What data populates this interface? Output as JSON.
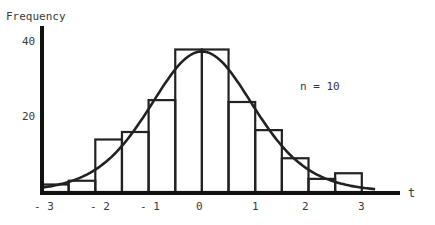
{
  "chart_data": {
    "type": "bar",
    "title": "",
    "ylabel": "Frequency",
    "xlabel": "t",
    "annotation": "n = 10",
    "xlim": [
      -3,
      3.3
    ],
    "ylim": [
      0,
      42
    ],
    "grid": false,
    "legend": null,
    "xticks": [
      "-3",
      "-2",
      "-1",
      "0",
      "1",
      "2",
      "3"
    ],
    "yticks": [
      "20",
      "40"
    ],
    "bin_edges": [
      -3,
      -2.5,
      -2,
      -1.5,
      -1,
      -0.5,
      0,
      0.5,
      1,
      1.5,
      2,
      2.5,
      3
    ],
    "categories": [
      "[-3,-2.5)",
      "[-2.5,-2)",
      "[-2,-1.5)",
      "[-1.5,-1)",
      "[-1,-0.5)",
      "[-0.5,0)",
      "[0,0.5)",
      "[0.5,1)",
      "[1,1.5)",
      "[1.5,2)",
      "[2,2.5)",
      "[2.5,3)"
    ],
    "values": [
      2,
      3,
      14,
      16,
      24.5,
      38,
      38,
      24,
      16.5,
      9,
      3.5,
      5
    ],
    "overlay_curve": {
      "type": "line",
      "description": "t-distribution density curve (df = 9) scaled to frequency",
      "peak": 37.5
    }
  },
  "labels": {
    "ylabel": "Frequency",
    "xlabel": "t",
    "annotation": "n = 10",
    "y40": "40",
    "y20": "20",
    "xm3": "- 3",
    "xm2": "- 2",
    "xm1": "- 1",
    "x0": "0",
    "x1": "1",
    "x2": "2",
    "x3": "3"
  }
}
